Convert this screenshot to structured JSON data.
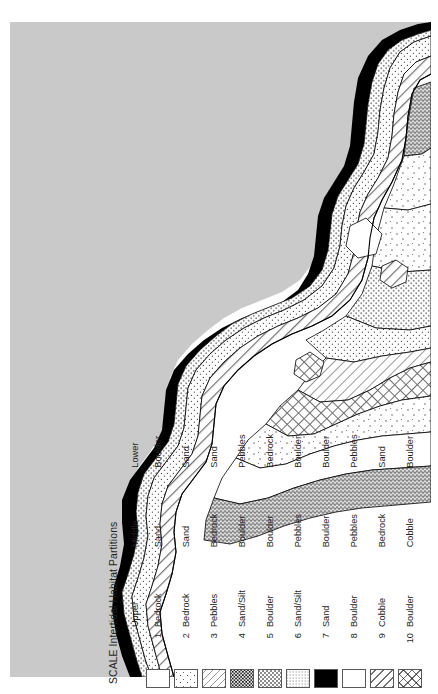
{
  "figure": {
    "kind": "thematic-map-with-legend",
    "orientation": "legend-and-title-rotated-90-ccw"
  },
  "legend": {
    "title": "SCALE Intertidal Habitat Partitions",
    "columns": [
      "",
      "",
      "Upper",
      "Middle",
      "Lower"
    ],
    "headers": {
      "upper": "Upper",
      "middle": "Middle",
      "lower": "Lower"
    },
    "rows": [
      {
        "no": "1",
        "upper": "Bedrock",
        "middle": "Sand",
        "lower": "Boulder",
        "pattern": "fine-stipple"
      },
      {
        "no": "2",
        "upper": "Bedrock",
        "middle": "Sand",
        "lower": "Sand",
        "pattern": "sparse-stipple"
      },
      {
        "no": "3",
        "upper": "Pebbles",
        "middle": "Bedrock",
        "lower": "Sand",
        "pattern": "light-diagonal"
      },
      {
        "no": "4",
        "upper": "Sand/Silt",
        "middle": "Boulder",
        "lower": "Pebbles",
        "pattern": "dense-speckle"
      },
      {
        "no": "5",
        "upper": "Boulder",
        "middle": "Boulder",
        "lower": "Bedrock",
        "pattern": "regular-dots"
      },
      {
        "no": "6",
        "upper": "Sand/Silt",
        "middle": "Pebbles",
        "lower": "Boulder",
        "pattern": "dense-texture"
      },
      {
        "no": "7",
        "upper": "Sand",
        "middle": "Boulder",
        "lower": "Boulder",
        "pattern": "solid-black"
      },
      {
        "no": "8",
        "upper": "Boulder",
        "middle": "Pebbles",
        "lower": "Pebbles",
        "pattern": "blank-white"
      },
      {
        "no": "9",
        "upper": "Cobble",
        "middle": "Bedrock",
        "lower": "Sand",
        "pattern": "diagonal-hatch"
      },
      {
        "no": "10",
        "upper": "Boulder",
        "middle": "Cobble",
        "lower": "Boulder",
        "pattern": "crosshatch"
      }
    ]
  },
  "map": {
    "ocean_color": "#c9c9c9",
    "land_color": "#ffffff",
    "outline_color": "#000000",
    "shore_band_color": "#000000",
    "description": "Coastline strip map with banded intertidal habitat partitions"
  },
  "colors": {
    "background": "#ffffff",
    "ocean": "#c9c9c9",
    "ink": "#231f20",
    "swatch_border": "#585858"
  }
}
